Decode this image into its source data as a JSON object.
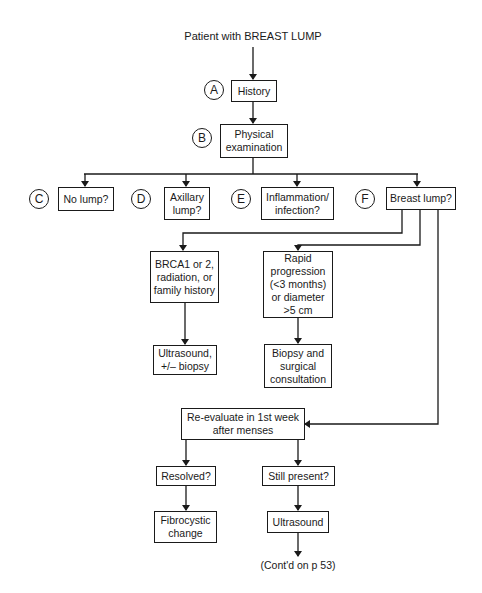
{
  "title": "Patient with BREAST LUMP",
  "steps": {
    "A": {
      "marker": "A",
      "label": "History"
    },
    "B": {
      "marker": "B",
      "label": "Physical\nexamination"
    },
    "C": {
      "marker": "C",
      "label": "No lump?"
    },
    "D": {
      "marker": "D",
      "label": "Axillary\nlump?"
    },
    "E": {
      "marker": "E",
      "label": "Inflammation/\ninfection?"
    },
    "F": {
      "marker": "F",
      "label": "Breast lump?"
    }
  },
  "branches": {
    "brca": "BRCA1 or 2,\nradiation, or\nfamily history",
    "ultrasound_biopsy": "Ultrasound,\n+/– biopsy",
    "rapid": "Rapid\nprogression\n(<3 months)\nor diameter\n>5 cm",
    "biopsy_surgical": "Biopsy and\nsurgical\nconsultation",
    "reevaluate": "Re-evaluate in 1st week\nafter menses",
    "resolved": "Resolved?",
    "fibrocystic": "Fibrocystic\nchange",
    "still_present": "Still present?",
    "ultrasound": "Ultrasound"
  },
  "continuation": "(Cont'd on p 53)"
}
